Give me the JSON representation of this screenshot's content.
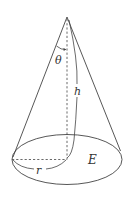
{
  "diagram": {
    "type": "cone",
    "stroke_color": "#444444",
    "labels": {
      "angle": "θ",
      "height": "h",
      "radius": "r",
      "base": "E"
    }
  }
}
